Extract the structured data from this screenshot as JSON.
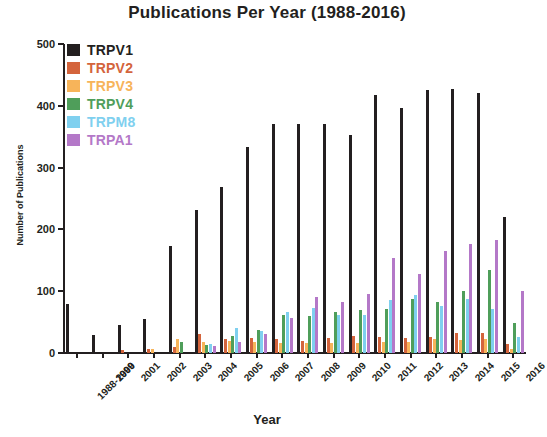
{
  "chart_data": {
    "type": "bar",
    "title": "Publications Per Year (1988-2016)",
    "xlabel": "Year",
    "ylabel": "Number of Publications",
    "ylim": [
      0,
      500
    ],
    "yticks": [
      0,
      100,
      200,
      300,
      400,
      500
    ],
    "grid": false,
    "legend_position": "top-left",
    "categories": [
      "1988-1999",
      "2000",
      "2001",
      "2002",
      "2003",
      "2004",
      "2005",
      "2006",
      "2007",
      "2008",
      "2009",
      "2010",
      "2011",
      "2012",
      "2013",
      "2014",
      "2015",
      "2016"
    ],
    "series": [
      {
        "name": "TRPV1",
        "color": "#231f20",
        "values": [
          80,
          29,
          45,
          55,
          173,
          232,
          268,
          334,
          370,
          370,
          370,
          352,
          417,
          397,
          425,
          427,
          420,
          220
        ]
      },
      {
        "name": "TRPV2",
        "color": "#d4643c",
        "values": [
          0,
          0,
          5,
          6,
          10,
          30,
          22,
          24,
          22,
          20,
          24,
          28,
          26,
          24,
          26,
          33,
          33,
          15
        ]
      },
      {
        "name": "TRPV3",
        "color": "#f7b45a",
        "values": [
          0,
          0,
          0,
          6,
          22,
          18,
          20,
          18,
          16,
          16,
          17,
          17,
          18,
          18,
          22,
          21,
          23,
          7
        ]
      },
      {
        "name": "TRPV4",
        "color": "#4f9e5a",
        "values": [
          0,
          0,
          0,
          0,
          18,
          13,
          28,
          38,
          62,
          60,
          67,
          70,
          72,
          88,
          83,
          100,
          134,
          49
        ]
      },
      {
        "name": "TRPM8",
        "color": "#7fd0ef",
        "values": [
          0,
          0,
          0,
          0,
          0,
          14,
          40,
          36,
          66,
          73,
          61,
          62,
          86,
          94,
          76,
          88,
          72,
          26
        ]
      },
      {
        "name": "TRPA1",
        "color": "#b478c8",
        "values": [
          0,
          0,
          0,
          0,
          0,
          12,
          18,
          30,
          56,
          90,
          82,
          96,
          153,
          128,
          165,
          176,
          183,
          100
        ]
      }
    ]
  },
  "legend": {
    "items": [
      {
        "label": "TRPV1",
        "color": "#231f20"
      },
      {
        "label": "TRPV2",
        "color": "#d4643c"
      },
      {
        "label": "TRPV3",
        "color": "#f7b45a"
      },
      {
        "label": "TRPV4",
        "color": "#4f9e5a"
      },
      {
        "label": "TRPM8",
        "color": "#7fd0ef"
      },
      {
        "label": "TRPA1",
        "color": "#b478c8"
      }
    ]
  }
}
